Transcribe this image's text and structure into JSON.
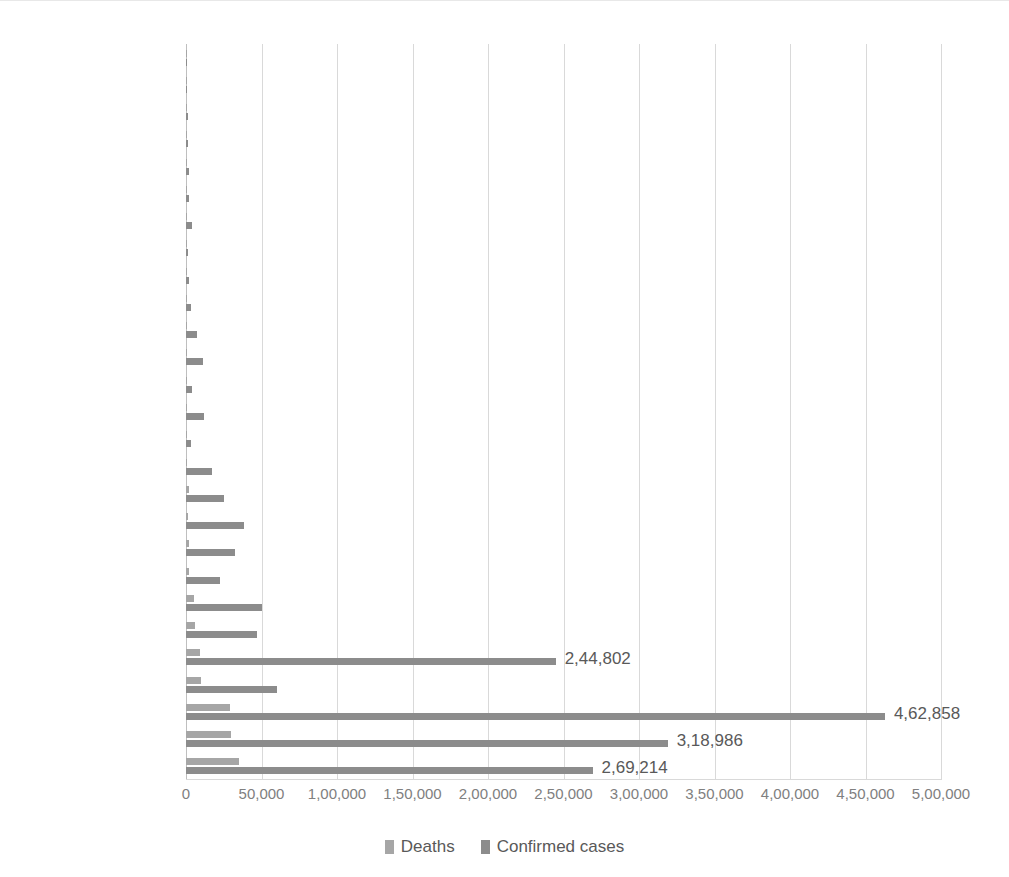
{
  "chart_data": {
    "type": "bar",
    "orientation": "horizontal",
    "title": "",
    "xlabel": "",
    "ylabel": "",
    "xlim": [
      0,
      500000
    ],
    "xtick_values": [
      0,
      50000,
      100000,
      150000,
      200000,
      250000,
      300000,
      350000,
      400000,
      450000,
      500000
    ],
    "xtick_labels": [
      "0",
      "50,000",
      "1,00,000",
      "1,50,000",
      "2,00,000",
      "2,50,000",
      "3,00,000",
      "3,50,000",
      "4,00,000",
      "4,50,000",
      "5,00,000"
    ],
    "number_format": "indian-grouping",
    "grid": true,
    "grid_axis": "x",
    "legend_position": "bottom",
    "categories": [
      "Malta",
      "Cyprus",
      "Slovakia",
      "Latvia",
      "Estonia",
      "Lithuania",
      "Luxembourg",
      "Slovenia",
      "Croatia",
      "Greece",
      "Finland",
      "Czech Republic",
      "Hungary",
      "Denmark",
      "Bulgaria",
      "Austria",
      "Ireland",
      "Portugal",
      "Poland",
      "Romania",
      "Sweden",
      "Netherlands",
      "Germany",
      "Belgium",
      "Spain",
      "France",
      "Italy"
    ],
    "series": [
      {
        "name": "Deaths",
        "color": "#a6a6a6",
        "values": [
          9,
          19,
          28,
          30,
          69,
          80,
          110,
          111,
          107,
          192,
          328,
          350,
          586,
          609,
          508,
          710,
          1746,
          1576,
          1675,
          2286,
          5482,
          6146,
          9024,
          9787,
          29043,
          29547,
          35042
        ]
      },
      {
        "name": "Confirmed cases",
        "color": "#8c8c8c",
        "values": [
          665,
          985,
          1581,
          1088,
          1961,
          1795,
          4083,
          1488,
          2291,
          3144,
          7035,
          11298,
          4038,
          11962,
          3453,
          17078,
          25374,
          38089,
          32227,
          22760,
          50387,
          47152,
          244802,
          60550,
          462858,
          318986,
          269214
        ]
      }
    ],
    "data_labels": [
      {
        "category": "Germany",
        "series": "Confirmed cases",
        "text": "2,44,802"
      },
      {
        "category": "Spain",
        "series": "Confirmed cases",
        "text": "4,62,858"
      },
      {
        "category": "France",
        "series": "Confirmed cases",
        "text": "3,18,986"
      },
      {
        "category": "Italy",
        "series": "Confirmed cases",
        "text": "2,69,214"
      }
    ]
  },
  "legend": {
    "items": [
      {
        "label": "Deaths",
        "color": "#a6a6a6"
      },
      {
        "label": "Confirmed cases",
        "color": "#8c8c8c"
      }
    ]
  }
}
